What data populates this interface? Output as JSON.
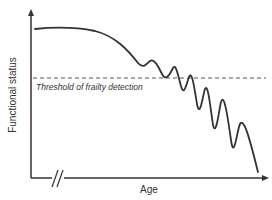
{
  "diagram": {
    "y_axis_label": "Functional status",
    "x_axis_label": "Age",
    "threshold_label": "Threshold of frailty detection",
    "axis_break_symbol": "//",
    "colors": {
      "line": "#333333",
      "axis": "#333333",
      "threshold": "#555555",
      "background": "#ffffff"
    },
    "curve_points": [
      [
        35,
        29
      ],
      [
        75,
        28
      ],
      [
        110,
        38
      ],
      [
        135,
        60
      ],
      [
        141,
        67
      ],
      [
        148,
        64
      ],
      [
        151,
        61
      ],
      [
        158,
        66
      ],
      [
        165,
        80
      ],
      [
        171,
        72
      ],
      [
        175,
        67
      ],
      [
        180,
        80
      ],
      [
        185,
        98
      ],
      [
        189,
        80
      ],
      [
        192,
        74
      ],
      [
        196,
        95
      ],
      [
        200,
        118
      ],
      [
        203,
        96
      ],
      [
        206,
        88
      ],
      [
        210,
        110
      ],
      [
        215,
        135
      ],
      [
        219,
        108
      ],
      [
        223,
        98
      ],
      [
        229,
        130
      ],
      [
        235,
        162
      ],
      [
        238,
        135
      ],
      [
        241,
        124
      ],
      [
        249,
        145
      ],
      [
        258,
        172
      ]
    ],
    "threshold_y": 78
  }
}
